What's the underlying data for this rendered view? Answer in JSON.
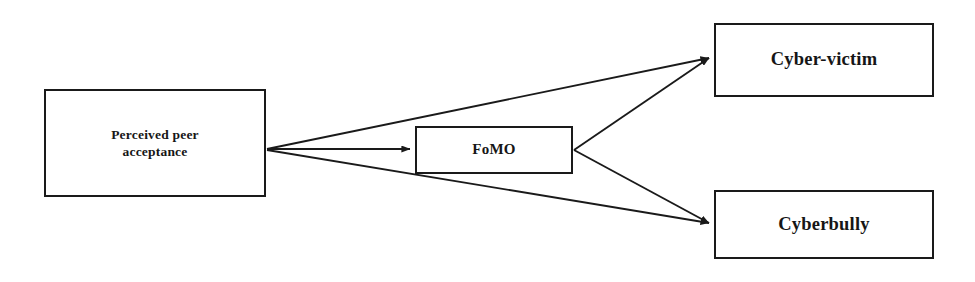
{
  "figure": {
    "type": "path-diagram",
    "background_color": "#ffffff",
    "line_color": "#1a1a1a",
    "text_color": "#161616",
    "width": 975,
    "height": 282
  },
  "nodes": [
    {
      "id": "perceived-peer-acceptance",
      "label": "Perceived peer\nacceptance",
      "x": 44,
      "y": 89,
      "width": 222,
      "height": 108
    },
    {
      "id": "fomo",
      "label": "FoMO",
      "x": 415,
      "y": 126,
      "width": 158,
      "height": 48
    },
    {
      "id": "cyber-victim",
      "label": "Cyber-victim",
      "x": 714,
      "y": 23,
      "width": 220,
      "height": 74
    },
    {
      "id": "cyberbully",
      "label": "Cyberbully",
      "x": 714,
      "y": 190,
      "width": 220,
      "height": 69
    }
  ],
  "edges": [
    {
      "id": "ppa-to-cyber-victim",
      "from": "perceived-peer-acceptance",
      "to": "cyber-victim",
      "label": "",
      "x1": 267,
      "y1": 149,
      "x2": 709,
      "y2": 58
    },
    {
      "id": "ppa-to-fomo",
      "from": "perceived-peer-acceptance",
      "to": "fomo",
      "label": "",
      "x1": 267,
      "y1": 149,
      "x2": 410,
      "y2": 149
    },
    {
      "id": "ppa-to-cyberbully",
      "from": "perceived-peer-acceptance",
      "to": "cyberbully",
      "label": "",
      "x1": 267,
      "y1": 150,
      "x2": 709,
      "y2": 223
    },
    {
      "id": "fomo-to-cyber-victim",
      "from": "fomo",
      "to": "cyber-victim",
      "label": "",
      "x1": 574,
      "y1": 150,
      "x2": 709,
      "y2": 58
    },
    {
      "id": "fomo-to-cyberbully",
      "from": "fomo",
      "to": "cyberbully",
      "label": "",
      "x1": 574,
      "y1": 150,
      "x2": 709,
      "y2": 223
    }
  ]
}
